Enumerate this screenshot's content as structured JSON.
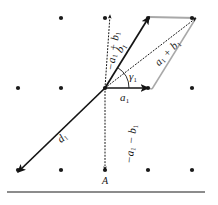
{
  "figure": {
    "caption_letter": "A",
    "colors": {
      "ink": "#141414",
      "lattice_dot": "#1a1a1a",
      "parallelogram_edge": "#a8a8a8",
      "rule": "#8c8c8c",
      "background": "#ffffff"
    },
    "origin": {
      "x": 105,
      "y": 88
    },
    "lattice": {
      "rows_y": [
        18,
        88,
        170
      ],
      "cols_x": [
        18,
        61,
        105,
        148,
        192
      ],
      "dot_radius": 2.1,
      "points": [
        {
          "x": 61,
          "y": 18
        },
        {
          "x": 105,
          "y": 18
        },
        {
          "x": 148,
          "y": 18
        },
        {
          "x": 192,
          "y": 18
        },
        {
          "x": 18,
          "y": 88
        },
        {
          "x": 61,
          "y": 88
        },
        {
          "x": 105,
          "y": 88
        },
        {
          "x": 148,
          "y": 88
        },
        {
          "x": 192,
          "y": 88
        },
        {
          "x": 18,
          "y": 170
        },
        {
          "x": 61,
          "y": 170
        },
        {
          "x": 105,
          "y": 170
        },
        {
          "x": 148,
          "y": 170
        },
        {
          "x": 192,
          "y": 170
        }
      ]
    },
    "vectors": [
      {
        "id": "a1",
        "label_base": "a",
        "label_sub": "1",
        "label_text": "a₁",
        "style": "solid",
        "from": {
          "x": 105,
          "y": 88
        },
        "to": {
          "x": 148,
          "y": 88
        },
        "label_pos": {
          "x": 120,
          "y": 92
        }
      },
      {
        "id": "b1",
        "label_base": "b",
        "label_sub": "1",
        "label_text": "b₁",
        "style": "solid",
        "from": {
          "x": 105,
          "y": 88
        },
        "to": {
          "x": 149,
          "y": 17
        },
        "label_pos": {
          "x": 117,
          "y": 42
        }
      },
      {
        "id": "a1-plus-b1",
        "label_base": "a",
        "label_sub": "1",
        "label_text": "a₁ + b₁",
        "style": "dotted",
        "from": {
          "x": 105,
          "y": 88
        },
        "to": {
          "x": 196,
          "y": 18
        },
        "label_pos": {
          "x": 152,
          "y": 47
        }
      },
      {
        "id": "minus-a1-plus-b1",
        "label_base": "−a",
        "label_sub": "1",
        "label_text": "−a₁ + b₁",
        "style": "dotted",
        "from": {
          "x": 105,
          "y": 88
        },
        "to": {
          "x": 110,
          "y": 15
        },
        "label_pos": {
          "x": 94,
          "y": 45
        }
      },
      {
        "id": "minus-a1-minus-b1",
        "label_base": "−a",
        "label_sub": "1",
        "label_text": "−a₁ − b₁",
        "style": "dotted",
        "from": {
          "x": 105,
          "y": 88
        },
        "to": {
          "x": 105,
          "y": 170
        },
        "label_pos": {
          "x": 112,
          "y": 138
        }
      },
      {
        "id": "d1",
        "label_base": "d",
        "label_sub": "1",
        "label_text": "d₁",
        "style": "solid",
        "from": {
          "x": 105,
          "y": 88
        },
        "to": {
          "x": 18,
          "y": 172
        },
        "label_pos": {
          "x": 58,
          "y": 132
        }
      }
    ],
    "angle": {
      "id": "gamma1",
      "label_text": "γ₁",
      "label_pos": {
        "x": 129,
        "y": 71
      },
      "vertex": {
        "x": 105,
        "y": 88
      },
      "radius": 24,
      "start_deg": 0,
      "end_deg": 58
    },
    "parallelogram": {
      "vertices": [
        {
          "x": 105,
          "y": 88
        },
        {
          "x": 148,
          "y": 88
        },
        {
          "x": 196,
          "y": 18
        },
        {
          "x": 149,
          "y": 17
        }
      ],
      "edges_drawn": [
        "top",
        "right",
        "far-right-down"
      ]
    },
    "rule": {
      "x": 7,
      "y": 191,
      "width": 198,
      "height": 2
    }
  }
}
